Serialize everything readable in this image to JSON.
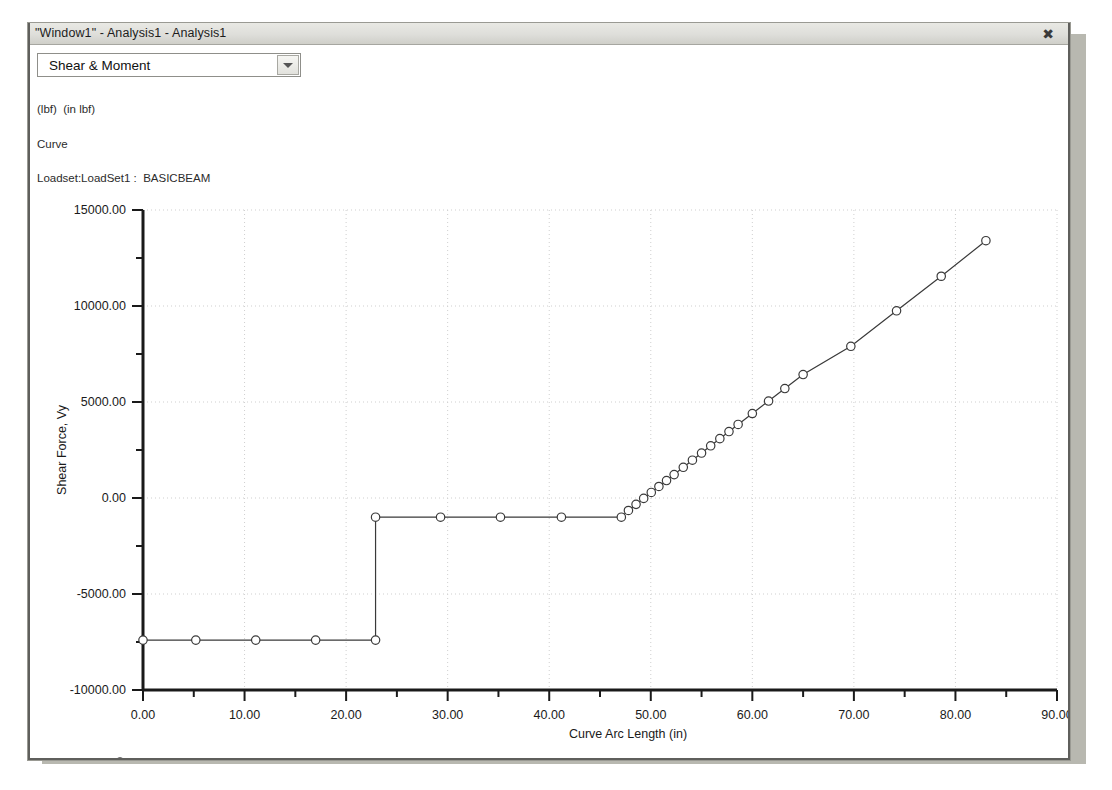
{
  "window": {
    "title": "\"Window1\" - Analysis1 - Analysis1",
    "close_label": "✖",
    "close_icon": "close-icon"
  },
  "toolbar": {
    "result_select": {
      "selected": "Shear & Moment",
      "options": [
        "Shear & Moment"
      ],
      "arrow_icon": "chevron-down-icon"
    }
  },
  "subtitle": {
    "units_line": "(lbf)  (in lbf)",
    "type_line": "Curve",
    "loadset_line": "Loadset:LoadSet1 :  BASICBEAM"
  },
  "legend": {
    "entries": [
      {
        "label": "Shear Force, Vy",
        "marker": "circle",
        "color": "#3a3a3a"
      }
    ]
  },
  "chart_data": {
    "type": "line",
    "title": "",
    "xlabel": "Curve Arc Length (in)",
    "ylabel": "Shear Force, Vy",
    "xlim": [
      0.0,
      90.0
    ],
    "ylim": [
      -10000.0,
      15000.0
    ],
    "xticks": [
      0.0,
      10.0,
      20.0,
      30.0,
      40.0,
      50.0,
      60.0,
      70.0,
      80.0,
      90.0
    ],
    "xticklabels": [
      "0.00",
      "10.00",
      "20.00",
      "30.00",
      "40.00",
      "50.00",
      "60.00",
      "70.00",
      "80.00",
      "90.00"
    ],
    "xminor_step": 5.0,
    "yticks": [
      -10000.0,
      -5000.0,
      0.0,
      5000.0,
      10000.0,
      15000.0
    ],
    "yticklabels": [
      "-10000.00",
      "-5000.00",
      "0.00",
      "5000.00",
      "10000.00",
      "15000.00"
    ],
    "yminor_step": 2500.0,
    "grid": true,
    "grid_style": "dotted",
    "legend_position": "below-axes-left",
    "series": [
      {
        "name": "Shear Force, Vy",
        "color": "#3a3a3a",
        "marker": "circle",
        "x": [
          0.0,
          5.2,
          11.1,
          17.0,
          22.9,
          22.9,
          29.3,
          35.2,
          41.2,
          47.1,
          47.8,
          48.55,
          49.3,
          50.05,
          50.8,
          51.55,
          52.3,
          53.2,
          54.1,
          55.0,
          55.9,
          56.8,
          57.7,
          58.6,
          60.0,
          61.6,
          63.2,
          65.0,
          69.7,
          74.2,
          78.6,
          83.0
        ],
        "y": [
          -7400,
          -7400,
          -7400,
          -7400,
          -7400,
          -1000,
          -1000,
          -1000,
          -1000,
          -1000,
          -650,
          -330,
          -20,
          290,
          600,
          910,
          1220,
          1600,
          1970,
          2340,
          2720,
          3090,
          3460,
          3830,
          4400,
          5050,
          5700,
          6430,
          7900,
          9750,
          11550,
          13400
        ]
      }
    ]
  }
}
